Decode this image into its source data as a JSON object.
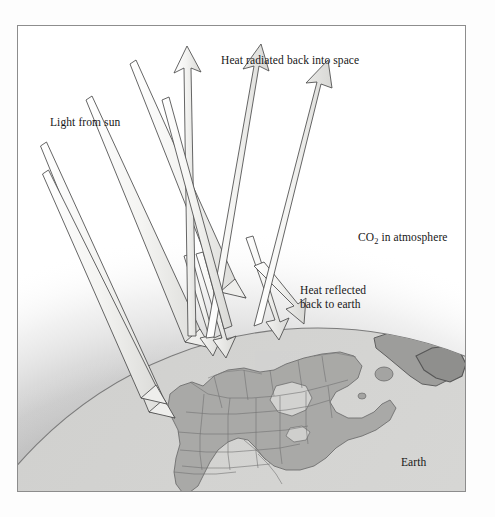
{
  "figure": {
    "domain": "diagram",
    "title_internal": "greenhouse-effect-diagram",
    "frame": {
      "border_color": "#8d8d8d",
      "background": "#ffffff"
    }
  },
  "labels": {
    "heat_radiated": "Heat radiated back into space",
    "light_from_sun": "Light from sun",
    "co2_prefix": "CO",
    "co2_subscript": "2",
    "co2_suffix": " in atmosphere",
    "heat_reflected_line1": "Heat reflected",
    "heat_reflected_line2": "back to earth",
    "earth": "Earth"
  },
  "colors": {
    "arrow_fill": "#f2f2f0",
    "arrow_fill_shaded": "#dcdcda",
    "arrow_stroke": "#4a4a4a",
    "atmosphere_haze": "#9a9a9a",
    "globe_ocean": "#d4d4d2",
    "globe_land": "#a9a9a7",
    "globe_outline": "#6b6b6b",
    "text": "#171717",
    "frame": "#8d8d8d",
    "page_background": "#ffffff"
  },
  "elements": {
    "atmosphere_band_name": "co2-atmosphere-haze",
    "globe_name": "earth-globe",
    "continent_name": "north-america-landmass"
  },
  "arrows": {
    "incoming_sunlight": [
      {
        "name": "sunlight-ray-1",
        "x1": 26,
        "y1": 148,
        "x2": 166,
        "y2": 392
      },
      {
        "name": "sunlight-ray-2",
        "x1": 30,
        "y1": 196,
        "x2": 158,
        "y2": 388
      },
      {
        "name": "sunlight-ray-3",
        "x1": 64,
        "y1": 116,
        "x2": 200,
        "y2": 348
      },
      {
        "name": "sunlight-ray-4",
        "x1": 110,
        "y1": 74,
        "x2": 232,
        "y2": 330
      }
    ],
    "radiated_to_space": [
      {
        "name": "radiated-arrow-1",
        "x1": 212,
        "y1": 330,
        "x2": 186,
        "y2": 52
      },
      {
        "name": "radiated-arrow-2",
        "x1": 222,
        "y1": 330,
        "x2": 263,
        "y2": 57
      },
      {
        "name": "radiated-arrow-3",
        "x1": 252,
        "y1": 318,
        "x2": 325,
        "y2": 72
      }
    ],
    "reflected_back_to_earth": [
      {
        "name": "reflected-arrow-1",
        "x1": 186,
        "y1": 256,
        "x2": 214,
        "y2": 350
      },
      {
        "name": "reflected-arrow-2",
        "x1": 196,
        "y1": 254,
        "x2": 226,
        "y2": 352
      },
      {
        "name": "reflected-arrow-3",
        "x1": 246,
        "y1": 238,
        "x2": 280,
        "y2": 332
      }
    ]
  }
}
